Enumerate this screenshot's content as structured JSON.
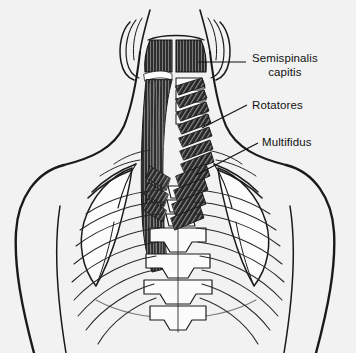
{
  "figure": {
    "background_color": "#f2f2f2",
    "ink_color": "#111111",
    "muscle_fill": "#2b2b2b",
    "bone_fill": "#fbfbfb"
  },
  "labels": [
    {
      "id": "semispinalis-capitis",
      "line1": "Semispinalis",
      "line2": "capitis",
      "text_x": 252,
      "text_y": 52,
      "leader": {
        "x1": 246,
        "y1": 62,
        "x2": 198,
        "y2": 62
      }
    },
    {
      "id": "rotatores",
      "line1": "Rotatores",
      "line2": "",
      "text_x": 252,
      "text_y": 99,
      "leader": {
        "x1": 247,
        "y1": 105,
        "x2": 202,
        "y2": 128
      }
    },
    {
      "id": "multifidus",
      "line1": "Multifidus",
      "line2": "",
      "text_x": 262,
      "text_y": 136,
      "leader": {
        "x1": 258,
        "y1": 143,
        "x2": 196,
        "y2": 175
      }
    }
  ]
}
